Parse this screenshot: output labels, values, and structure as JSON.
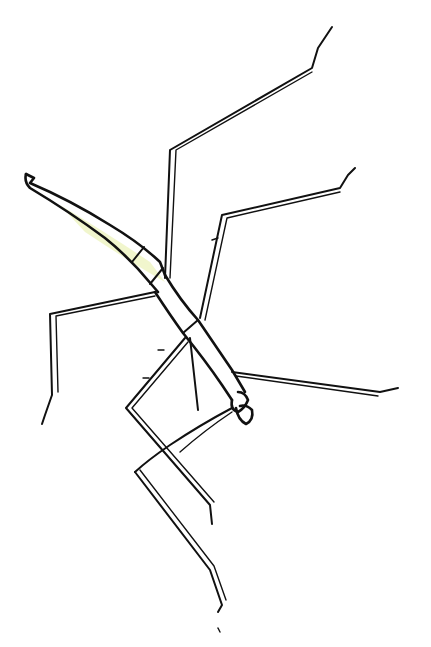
{
  "image": {
    "subject": "stick insect",
    "style": "black ink line drawing on white",
    "background_color": "#ffffff",
    "ink_color": "#111111",
    "accent_tint": "#e8f0b8"
  }
}
